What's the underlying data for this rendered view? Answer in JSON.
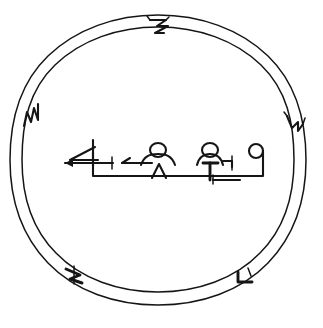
{
  "figure": {
    "kind": "line-drawing",
    "background_color": "#ffffff",
    "ink_color": "#151515",
    "canvas": {
      "width": 323,
      "height": 328
    }
  },
  "ring": {
    "name": "double-circle-border",
    "outer_circle": {
      "cx": 158,
      "cy": 160,
      "rx": 148,
      "ry": 145
    },
    "inner_circle": {
      "cx": 158,
      "cy": 160,
      "rx": 136,
      "ry": 133
    },
    "stroke_width": 1.6,
    "notch_count": 5,
    "notches": [
      {
        "position": "top",
        "glyph_name": "zigzag-notch-glyph",
        "angle_deg": 272
      },
      {
        "position": "upper-left",
        "glyph_name": "zigzag-notch-glyph",
        "angle_deg": 199
      },
      {
        "position": "upper-right",
        "glyph_name": "step-notch-glyph",
        "angle_deg": 341
      },
      {
        "position": "lower-left",
        "glyph_name": "curl-notch-glyph",
        "angle_deg": 132
      },
      {
        "position": "lower-right",
        "glyph_name": "hook-notch-glyph",
        "angle_deg": 48
      }
    ]
  },
  "inscription": {
    "name": "central-inscription",
    "baseline_y": 176,
    "left_x": 62,
    "right_x": 264,
    "glyph_count": 5,
    "glyphs": [
      {
        "index": 1,
        "name": "crossed-chevron-glyph",
        "description": "angled chevron crossed by a horizontal bar with leftward arrow tail"
      },
      {
        "index": 2,
        "name": "left-arrow-glyph",
        "description": "short horizontal stroke with small leftward arrowhead"
      },
      {
        "index": 3,
        "name": "domed-figure-glyph",
        "description": "round head over arched shoulders with a triangular base"
      },
      {
        "index": 4,
        "name": "pin-figure-glyph",
        "description": "round head over arched shoulders with a vertical stem and hooked arm"
      },
      {
        "index": 5,
        "name": "hooked-loop-glyph",
        "description": "small circle atop a descending stroke that turns left"
      }
    ]
  },
  "caption": {
    "name": "figure-caption",
    "text": " ",
    "note_visible": "cropped at bottom edge, illegible"
  }
}
